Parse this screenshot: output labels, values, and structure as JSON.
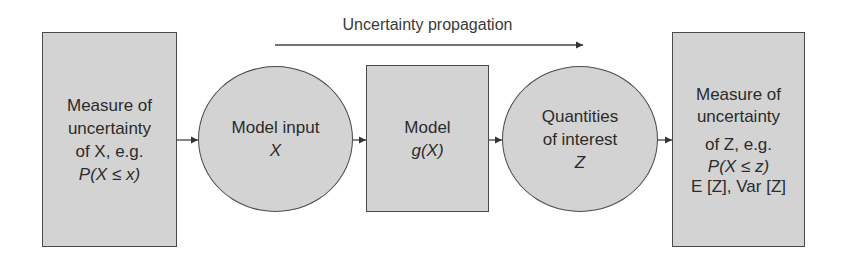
{
  "diagram": {
    "type": "flowchart",
    "direction": "left-to-right",
    "colors": {
      "node_fill": "#d3d3d3",
      "node_border": "#4a4a4a",
      "text": "#2b2b2b",
      "arrow": "#333333"
    },
    "top_label": "Uncertainty propagation",
    "nodes": [
      {
        "id": "input-uncertainty",
        "shape": "rectangle",
        "lines": [
          "Measure of",
          "uncertainty",
          "of X, e.g.",
          "P(X ≤ x)"
        ]
      },
      {
        "id": "model-input",
        "shape": "ellipse",
        "lines": [
          "Model input",
          "X"
        ]
      },
      {
        "id": "model",
        "shape": "rectangle",
        "lines": [
          "Model",
          "g(X)"
        ]
      },
      {
        "id": "quantities-of-interest",
        "shape": "ellipse",
        "lines": [
          "Quantities",
          "of interest",
          "Z"
        ]
      },
      {
        "id": "output-uncertainty",
        "shape": "rectangle",
        "lines": [
          "Measure of",
          "uncertainty",
          "of Z, e.g.",
          "P(X ≤ z)",
          "E [Z], Var [Z]"
        ]
      }
    ],
    "edges": [
      {
        "from": "input-uncertainty",
        "to": "model-input"
      },
      {
        "from": "model-input",
        "to": "model"
      },
      {
        "from": "model",
        "to": "quantities-of-interest"
      },
      {
        "from": "quantities-of-interest",
        "to": "output-uncertainty"
      }
    ]
  }
}
